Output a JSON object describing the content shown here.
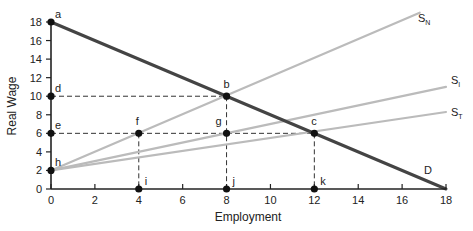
{
  "chart_data": {
    "type": "line",
    "title": "",
    "xlabel": "Employment",
    "ylabel": "Real Wage",
    "xlim": [
      0,
      18
    ],
    "ylim": [
      0,
      18
    ],
    "x_ticks": [
      0,
      2,
      4,
      6,
      8,
      10,
      12,
      14,
      16,
      18
    ],
    "y_ticks": [
      0,
      2,
      4,
      6,
      8,
      10,
      12,
      14,
      16,
      18
    ],
    "grid": false,
    "series": [
      {
        "name": "D",
        "label": "D",
        "points": [
          [
            0,
            18
          ],
          [
            18,
            0
          ]
        ],
        "color": "#444444"
      },
      {
        "name": "SN",
        "label": "S",
        "sub": "N",
        "points": [
          [
            0,
            2
          ],
          [
            16.8,
            19
          ]
        ],
        "color": "#bbbbbb"
      },
      {
        "name": "SI",
        "label": "S",
        "sub": "I",
        "points": [
          [
            0,
            2
          ],
          [
            18,
            11
          ]
        ],
        "color": "#bbbbbb"
      },
      {
        "name": "ST",
        "label": "S",
        "sub": "T",
        "points": [
          [
            0,
            2
          ],
          [
            18,
            8.3
          ]
        ],
        "color": "#bbbbbb"
      }
    ],
    "points": [
      {
        "label": "a",
        "x": 0,
        "y": 18
      },
      {
        "label": "b",
        "x": 8,
        "y": 10
      },
      {
        "label": "c",
        "x": 12,
        "y": 6
      },
      {
        "label": "d",
        "x": 0,
        "y": 10
      },
      {
        "label": "e",
        "x": 0,
        "y": 6
      },
      {
        "label": "f",
        "x": 4,
        "y": 6
      },
      {
        "label": "g",
        "x": 8,
        "y": 6
      },
      {
        "label": "h",
        "x": 0,
        "y": 2
      },
      {
        "label": "i",
        "x": 4,
        "y": 0
      },
      {
        "label": "j",
        "x": 8,
        "y": 0
      },
      {
        "label": "k",
        "x": 12,
        "y": 0
      }
    ],
    "dashed_guides": [
      {
        "from": [
          0,
          10
        ],
        "to": [
          8,
          10
        ]
      },
      {
        "from": [
          0,
          6
        ],
        "to": [
          12,
          6
        ]
      },
      {
        "from": [
          4,
          6
        ],
        "to": [
          4,
          0
        ]
      },
      {
        "from": [
          8,
          10
        ],
        "to": [
          8,
          0
        ]
      },
      {
        "from": [
          12,
          6
        ],
        "to": [
          12,
          0
        ]
      }
    ]
  }
}
